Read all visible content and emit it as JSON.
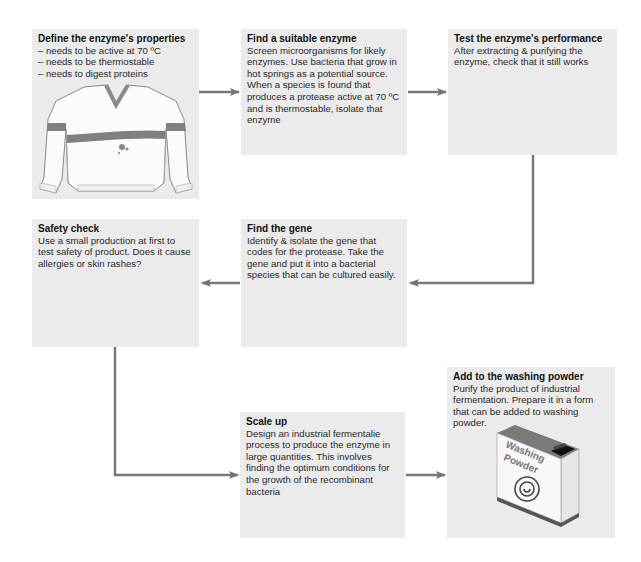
{
  "diagram": {
    "type": "flowchart",
    "colors": {
      "box_fill": "#ebebeb",
      "arrow": "#777777",
      "stripe": "#808080"
    },
    "steps": [
      {
        "id": "define",
        "title": "Define the enzyme's properties",
        "lines": [
          "– needs to be active at 70 ºC",
          "– needs to be thermostable",
          "– needs to digest proteins"
        ],
        "illustration": "sweater-icon"
      },
      {
        "id": "find-enzyme",
        "title": "Find a suitable enzyme",
        "body": "Screen microorganisms for likely enzymes. Use bacteria that grow in hot springs as a potential source. When a species is found that produces a protease active at 70 ºC and is thermostable, isolate that enzyme"
      },
      {
        "id": "test",
        "title": "Test the enzyme's performance",
        "body": "After extracting & purifying the enzyme, check that it still works"
      },
      {
        "id": "safety",
        "title": "Safety check",
        "body": "Use a small production at first to test safety of product. Does it cause allergies or skin rashes?"
      },
      {
        "id": "find-gene",
        "title": "Find the gene",
        "body": "Identify & isolate the gene that codes for the protease. Take the gene and put it into a bacterial species that can be cultured easily."
      },
      {
        "id": "scale-up",
        "title": "Scale up",
        "body": "Design an industrial fermentalie process to produce the enzyme in large quantities. This involves finding the optimum conditions for the growth of the recombinant bacteria"
      },
      {
        "id": "add-powder",
        "title": "Add to the washing powder",
        "body": "Purify the product of industrial fermentation. Prepare it in a form that can be added to washing powder.",
        "illustration": "washing-powder-box-icon",
        "box_label_line1": "Washing",
        "box_label_line2": "Powder"
      }
    ],
    "flow": [
      [
        "define",
        "find-enzyme"
      ],
      [
        "find-enzyme",
        "test"
      ],
      [
        "test",
        "find-gene"
      ],
      [
        "find-gene",
        "safety"
      ],
      [
        "safety",
        "scale-up"
      ],
      [
        "scale-up",
        "add-powder"
      ]
    ]
  }
}
